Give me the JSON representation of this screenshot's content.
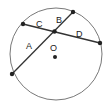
{
  "diagram": {
    "type": "circle-with-intersecting-chords",
    "center_label": "O",
    "segment_labels": {
      "A": "A",
      "B": "B",
      "C": "C",
      "D": "D"
    },
    "colors": {
      "stroke": "#333333",
      "circle": "#555555",
      "point": "#222222"
    }
  }
}
